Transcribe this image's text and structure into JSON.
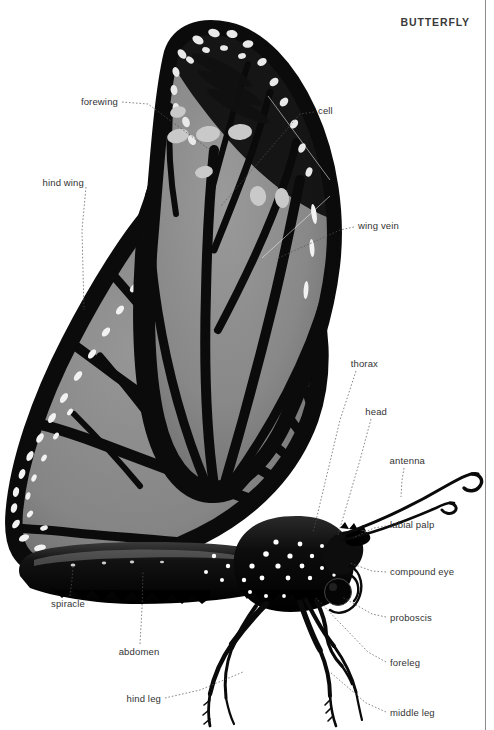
{
  "document": {
    "title": "BUTTERFLY",
    "subject": "butterfly-anatomy-diagram",
    "palette": {
      "background": "#ffffff",
      "wing_black": "#0b0b0b",
      "wing_gray": "#8a8a8a",
      "wing_gray_dark": "#6f6f6f",
      "spot_white": "#f2f2f2",
      "spot_gray": "#c9c9c9",
      "text": "#333333",
      "leader": "#555555",
      "rule": "#8d8d8d"
    }
  },
  "labels": [
    {
      "id": "forewing",
      "text": "forewing",
      "align": "l",
      "x": 118,
      "y": 102,
      "leader": [
        [
          122,
          102
        ],
        [
          148,
          104
        ],
        [
          210,
          150
        ]
      ]
    },
    {
      "id": "cell",
      "text": "cell",
      "align": "r",
      "x": 318,
      "y": 111,
      "leader": [
        [
          314,
          112
        ],
        [
          300,
          114
        ],
        [
          221,
          206
        ]
      ]
    },
    {
      "id": "hind-wing",
      "text": "hind wing",
      "align": "l",
      "x": 84,
      "y": 183,
      "leader": [
        [
          86,
          187
        ],
        [
          82,
          230
        ],
        [
          84,
          310
        ]
      ]
    },
    {
      "id": "wing-vein",
      "text": "wing vein",
      "align": "r",
      "x": 358,
      "y": 226,
      "leader": [
        [
          354,
          227
        ],
        [
          340,
          230
        ],
        [
          276,
          259
        ]
      ]
    },
    {
      "id": "thorax",
      "text": "thorax",
      "align": "l",
      "x": 378,
      "y": 364,
      "leader": [
        [
          356,
          371
        ],
        [
          340,
          420
        ],
        [
          313,
          533
        ]
      ]
    },
    {
      "id": "head",
      "text": "head",
      "align": "l",
      "x": 387,
      "y": 412,
      "leader": [
        [
          371,
          419
        ],
        [
          360,
          460
        ],
        [
          338,
          535
        ]
      ]
    },
    {
      "id": "antenna",
      "text": "antenna",
      "align": "l",
      "x": 425,
      "y": 461,
      "leader": [
        [
          404,
          468
        ],
        [
          402,
          480
        ],
        [
          401,
          497
        ]
      ]
    },
    {
      "id": "labial-palp",
      "text": "labial palp",
      "align": "r",
      "x": 390,
      "y": 525,
      "leader": [
        [
          386,
          526
        ],
        [
          374,
          528
        ],
        [
          353,
          538
        ]
      ]
    },
    {
      "id": "compound-eye",
      "text": "compound eye",
      "align": "r",
      "x": 390,
      "y": 572,
      "leader": [
        [
          386,
          572
        ],
        [
          372,
          571
        ],
        [
          350,
          563
        ]
      ]
    },
    {
      "id": "proboscis",
      "text": "proboscis",
      "align": "r",
      "x": 390,
      "y": 618,
      "leader": [
        [
          386,
          617
        ],
        [
          372,
          614
        ],
        [
          342,
          597
        ]
      ]
    },
    {
      "id": "foreleg",
      "text": "foreleg",
      "align": "r",
      "x": 390,
      "y": 663,
      "leader": [
        [
          386,
          662
        ],
        [
          368,
          652
        ],
        [
          316,
          598
        ]
      ]
    },
    {
      "id": "middle-leg",
      "text": "middle leg",
      "align": "r",
      "x": 390,
      "y": 713,
      "leader": [
        [
          386,
          712
        ],
        [
          366,
          703
        ],
        [
          330,
          672
        ]
      ]
    },
    {
      "id": "spiracle",
      "text": "spiracle",
      "align": "c",
      "x": 68,
      "y": 604,
      "leader": [
        [
          70,
          596
        ],
        [
          72,
          580
        ],
        [
          73,
          566
        ]
      ]
    },
    {
      "id": "abdomen",
      "text": "abdomen",
      "align": "c",
      "x": 139,
      "y": 652,
      "leader": [
        [
          140,
          644
        ],
        [
          142,
          608
        ],
        [
          143,
          572
        ]
      ]
    },
    {
      "id": "hind-leg",
      "text": "hind leg",
      "align": "l",
      "x": 161,
      "y": 699,
      "leader": [
        [
          165,
          698
        ],
        [
          200,
          690
        ],
        [
          243,
          672
        ]
      ]
    }
  ],
  "anatomy_parts": [
    "forewing",
    "hind wing",
    "cell",
    "wing vein",
    "thorax",
    "head",
    "antenna",
    "labial palp",
    "compound eye",
    "proboscis",
    "foreleg",
    "middle leg",
    "hind leg",
    "abdomen",
    "spiracle"
  ]
}
